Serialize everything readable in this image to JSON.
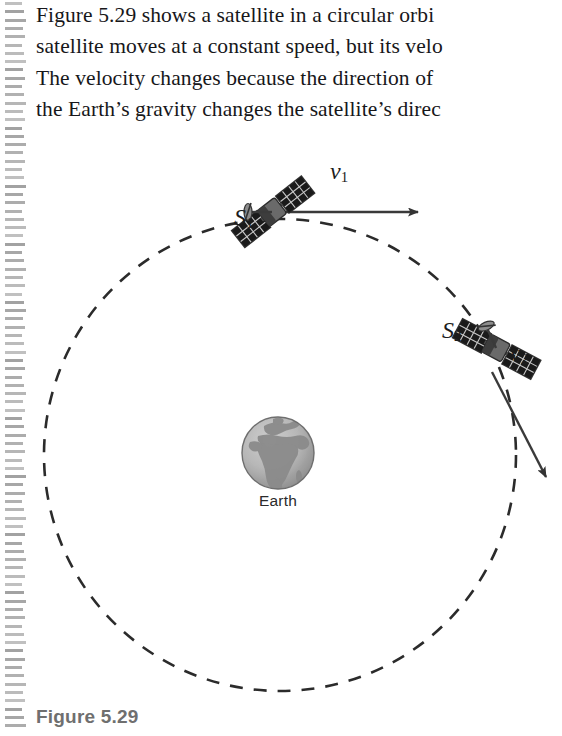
{
  "page": {
    "background_color": "#ffffff",
    "scan_artifact": {
      "name": "binding-dash-column",
      "dash_color": "#9a9a9a",
      "dash_count": 88,
      "dash_spacing_px": 8.3
    }
  },
  "body_text": {
    "lines": [
      "Figure 5.29 shows a satellite in a circular orbi",
      "satellite moves at a constant speed, but its velo",
      "The velocity changes because the direction of",
      "the Earth’s gravity changes the satellite’s direc"
    ]
  },
  "figure": {
    "caption": "Figure 5.29",
    "orbit": {
      "name": "orbit-circle",
      "style": "dashed",
      "stroke_color": "#2b2b2b",
      "center_x": 280,
      "center_y": 315,
      "radius": 236,
      "dash_pattern": "13 11"
    },
    "earth": {
      "label": "Earth",
      "center_x": 278,
      "center_y": 313,
      "radius": 36,
      "ocean_color": "#b9b9b9",
      "land_color": "#8e8e8e",
      "outline_color": "#6e6e6e"
    },
    "satellites": [
      {
        "id": "S1",
        "label": "S",
        "subscript": "1",
        "label_x": 236,
        "label_y": 80,
        "body_x": 272,
        "body_y": 72,
        "rotation_deg": -38
      },
      {
        "id": "S2",
        "label": "S",
        "subscript": "2",
        "label_x": 444,
        "label_y": 193,
        "body_x": 496,
        "body_y": 208,
        "rotation_deg": 28
      }
    ],
    "velocity_vectors": [
      {
        "id": "v1",
        "label": "v",
        "subscript": "1",
        "label_x": 332,
        "label_y": 33,
        "from_x": 275,
        "from_y": 72,
        "to_x": 423,
        "to_y": 72,
        "stroke_color": "#3a3a3a"
      },
      {
        "id": "v2",
        "label": "v",
        "subscript": "2",
        "label_x": 512,
        "label_y": 215,
        "from_x": 497,
        "from_y": 238,
        "to_x": 551,
        "to_y": 343,
        "stroke_color": "#3a3a3a"
      }
    ]
  }
}
